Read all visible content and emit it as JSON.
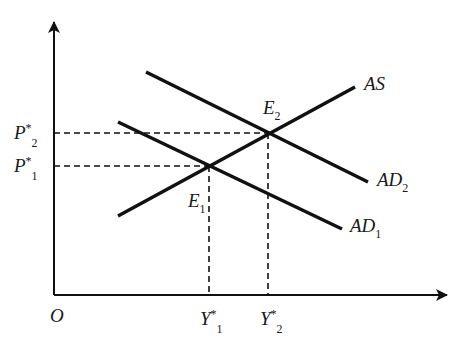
{
  "diagram": {
    "title": "",
    "colors": {
      "line": "#111111",
      "background": "#ffffff"
    },
    "axes": {
      "origin_label": "O",
      "x_axis": {
        "from": [
          54,
          295
        ],
        "to": [
          449,
          295
        ]
      },
      "y_axis": {
        "from": [
          54,
          295
        ],
        "to": [
          54,
          20
        ]
      }
    },
    "curves": [
      {
        "id": "AS",
        "label": "AS",
        "sub": "",
        "from": [
          118,
          216
        ],
        "to": [
          355,
          87
        ]
      },
      {
        "id": "AD2",
        "label": "AD",
        "sub": "2",
        "from": [
          146,
          72
        ],
        "to": [
          368,
          182
        ]
      },
      {
        "id": "AD1",
        "label": "AD",
        "sub": "1",
        "from": [
          118,
          122
        ],
        "to": [
          342,
          229
        ]
      }
    ],
    "equilibria": [
      {
        "id": "E1",
        "label": "E",
        "sub": "1",
        "point": [
          209,
          166
        ]
      },
      {
        "id": "E2",
        "label": "E",
        "sub": "2",
        "point": [
          268,
          133
        ]
      }
    ],
    "price_labels": [
      {
        "label": "P",
        "sup": "*",
        "sub": "2",
        "y": 133
      },
      {
        "label": "P",
        "sup": "*",
        "sub": "1",
        "y": 166
      }
    ],
    "output_labels": [
      {
        "label": "Y",
        "sup": "*",
        "sub": "1",
        "x": 209
      },
      {
        "label": "Y",
        "sup": "*",
        "sub": "2",
        "x": 268
      }
    ]
  }
}
